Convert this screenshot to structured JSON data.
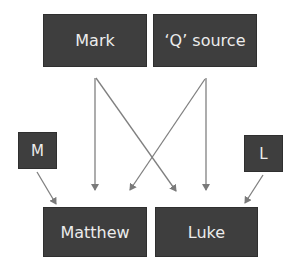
{
  "diagram": {
    "type": "source-dependency",
    "nodes": [
      {
        "id": "mark",
        "label": "Mark"
      },
      {
        "id": "q",
        "label": "‘Q’ source"
      },
      {
        "id": "m",
        "label": "M"
      },
      {
        "id": "l",
        "label": "L"
      },
      {
        "id": "matthew",
        "label": "Matthew"
      },
      {
        "id": "luke",
        "label": "Luke"
      }
    ],
    "edges": [
      {
        "from": "mark",
        "to": "matthew"
      },
      {
        "from": "mark",
        "to": "luke"
      },
      {
        "from": "q",
        "to": "matthew"
      },
      {
        "from": "q",
        "to": "luke"
      },
      {
        "from": "m",
        "to": "matthew"
      },
      {
        "from": "l",
        "to": "luke"
      }
    ],
    "colors": {
      "box_fill": "#3e3e3e",
      "box_text": "#ececec",
      "arrow": "#808080",
      "background": "#ffffff"
    }
  }
}
